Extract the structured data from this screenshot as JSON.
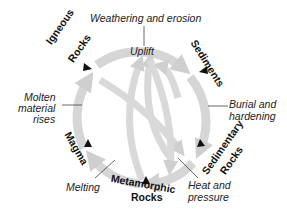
{
  "diagram": {
    "rocks": {
      "igneous": "Igneous\nRocks",
      "igneous_line1": "Igneous",
      "igneous_line2": "Rocks",
      "sediments": "Sediments",
      "sedimentary_line1": "Sedimentary",
      "sedimentary_line2": "Rocks",
      "metamorphic_line1": "Metamorphic",
      "metamorphic_line2": "Rocks",
      "magma": "Magma"
    },
    "processes": {
      "weathering": "Weathering and erosion",
      "uplift": "Uplift",
      "burial_line1": "Burial and",
      "burial_line2": "hardening",
      "heat_line1": "Heat and",
      "heat_line2": "pressure",
      "melting": "Melting",
      "molten_line1": "Molten",
      "molten_line2": "material",
      "molten_line3": "rises"
    },
    "colors": {
      "arrow": "#d3d3d3",
      "arrow_dark": "#bdbdbd",
      "marker": "#111111",
      "text": "#222222"
    }
  }
}
